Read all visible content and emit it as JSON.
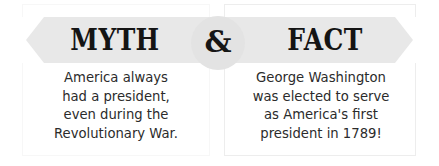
{
  "graphic": {
    "type": "myth-vs-fact-comparison",
    "width": 439,
    "height": 166,
    "background_color": "#ffffff"
  },
  "banner": {
    "name": "ribbon-banner",
    "fill_color": "#e8e8e8",
    "notch_color": "#ffffff"
  },
  "divider": {
    "symbol": "&",
    "icon_name": "ampersand-badge",
    "circle_color": "#e3e3e3",
    "text_color": "#161616"
  },
  "left_panel": {
    "heading": "MYTH",
    "heading_color": "#141414",
    "border_color": "#f7f7f7",
    "body_lines": [
      "America always",
      "had a president,",
      "even during the",
      "Revolutionary War."
    ],
    "body_text": "America always had a president, even during the Revolutionary War."
  },
  "right_panel": {
    "heading": "FACT",
    "heading_color": "#141414",
    "border_color": "#ededed",
    "body_lines": [
      "George Washington",
      "was elected to serve",
      "as America's first",
      "president in 1789!"
    ],
    "body_text": "George Washington was elected to serve as America's first president in 1789!"
  }
}
